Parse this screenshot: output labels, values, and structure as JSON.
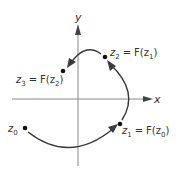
{
  "diagram": {
    "type": "complex-plane-iteration",
    "axes": {
      "x_label": "x",
      "y_label": "y"
    },
    "points": [
      {
        "id": "z0",
        "base": "z",
        "sub": "0",
        "rhs": "",
        "rhs_sub": ""
      },
      {
        "id": "z1",
        "base": "z",
        "sub": "1",
        "rhs": "F(z",
        "rhs_sub": "0"
      },
      {
        "id": "z2",
        "base": "z",
        "sub": "2",
        "rhs": "F(z",
        "rhs_sub": "1"
      },
      {
        "id": "z3",
        "base": "z",
        "sub": "3",
        "rhs": "F(z",
        "rhs_sub": "2"
      }
    ],
    "equals": "=",
    "close_paren": ")",
    "arrows": [
      {
        "from": "z0",
        "to": "z1"
      },
      {
        "from": "z1",
        "to": "z2"
      },
      {
        "from": "z2",
        "to": "z3"
      }
    ],
    "colors": {
      "axis": "#8a8a8a",
      "curve": "#3a3a3a",
      "dot": "#111111",
      "text": "#333333"
    }
  }
}
